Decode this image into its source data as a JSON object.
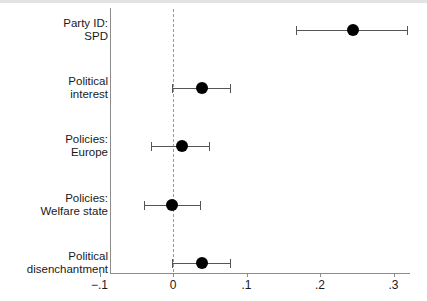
{
  "chart_data": {
    "type": "scatter",
    "title": "",
    "subtitle": "",
    "xlabel": "",
    "ylabel": "",
    "xlim": [
      -0.1,
      0.32
    ],
    "xticks": [
      -0.1,
      0,
      0.1,
      0.2,
      0.3
    ],
    "xticklabels": [
      "−.1",
      "0",
      ".1",
      ".2",
      ".3"
    ],
    "grid": false,
    "legend": null,
    "reference_line": 0,
    "reference_line_style": "dashed",
    "orientation": "horizontal",
    "categories": [
      "Party ID: SPD",
      "Political interest",
      "Policies: Europe",
      "Policies: Welfare state",
      "Political disenchantment"
    ],
    "points": [
      {
        "label_line1": "Party ID:",
        "label_line2": "SPD",
        "estimate": 0.245,
        "ci_low": 0.168,
        "ci_high": 0.318
      },
      {
        "label_line1": "Political",
        "label_line2": "interest",
        "estimate": 0.039,
        "ci_low": -0.002,
        "ci_high": 0.078
      },
      {
        "label_line1": "Policies:",
        "label_line2": "Europe",
        "estimate": 0.012,
        "ci_low": -0.03,
        "ci_high": 0.049
      },
      {
        "label_line1": "Policies:",
        "label_line2": "Welfare state",
        "estimate": -0.001,
        "ci_low": -0.039,
        "ci_high": 0.037
      },
      {
        "label_line1": "Political",
        "label_line2": "disenchantment",
        "estimate": 0.039,
        "ci_low": -0.001,
        "ci_high": 0.078
      }
    ],
    "colors": {
      "point": "#000000",
      "ci": "#555555",
      "axis": "#8c8c8c",
      "reference": "#9a9a9a",
      "background": "#ffffff"
    }
  }
}
